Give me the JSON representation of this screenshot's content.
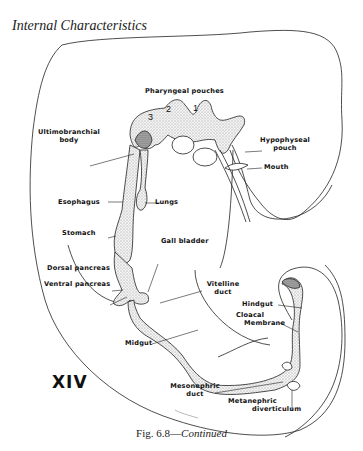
{
  "header": {
    "title": "Internal Characteristics"
  },
  "figure": {
    "stage": "XIV",
    "caption_prefix": "Fig. 6.8—",
    "caption_suffix": "Continued",
    "labels": {
      "pharyngeal_pouches": "Pharyngeal pouches",
      "pouch_numbers": [
        "3",
        "2",
        "1"
      ],
      "ultimobranchial_body": [
        "Ultimobranchial",
        "body"
      ],
      "hypophyseal_pouch": [
        "Hypophyseal",
        "pouch"
      ],
      "mouth": "Mouth",
      "esophagus": "Esophagus",
      "lungs": "Lungs",
      "stomach": "Stomach",
      "gall_bladder": "Gall bladder",
      "dorsal_pancreas": "Dorsal pancreas",
      "ventral_pancreas": "Ventral pancreas",
      "vitelline_duct": [
        "Vitelline",
        "duct"
      ],
      "hindgut": "Hindgut",
      "cloacal_membrane": [
        "Cloacal",
        "Membrane"
      ],
      "midgut": "Midgut",
      "mesonephric_duct": [
        "Mesonephric",
        "duct"
      ],
      "metanephric_diverticulum": [
        "Metanephric",
        "diverticulum"
      ]
    }
  }
}
